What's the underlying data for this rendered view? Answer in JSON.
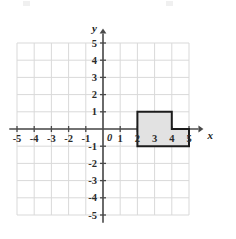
{
  "figure": {
    "axis_labels": {
      "x": "x",
      "y": "y"
    },
    "origin_label": "0"
  },
  "chart_data": {
    "type": "scatter",
    "title": "",
    "xlabel": "x",
    "ylabel": "y",
    "xlim": [
      -5.5,
      5.5
    ],
    "ylim": [
      -5.5,
      5.5
    ],
    "grid": true,
    "grid_step": 1,
    "legend": "none",
    "x_ticks": [
      -5,
      -4,
      -3,
      -2,
      -1,
      1,
      2,
      3,
      4,
      5
    ],
    "y_ticks": [
      -5,
      -4,
      -3,
      -2,
      -1,
      1,
      2,
      3,
      4,
      5
    ],
    "x_tick_labels": [
      "-5",
      "-4",
      "-3",
      "-2",
      "-1",
      "1",
      "2",
      "3",
      "4",
      "5"
    ],
    "y_tick_labels": [
      "-5",
      "-4",
      "-3",
      "-2",
      "-1",
      "1",
      "2",
      "3",
      "4",
      "5"
    ],
    "shapes": [
      {
        "name": "shaded-polygon",
        "kind": "polygon",
        "fill": "#e2e2e2",
        "stroke": "#1c1c1c",
        "stroke_width": 2,
        "vertices": [
          [
            2,
            1
          ],
          [
            4,
            1
          ],
          [
            4,
            0
          ],
          [
            5,
            0
          ],
          [
            5,
            -1
          ],
          [
            2,
            -1
          ]
        ],
        "description": "L-shaped region: rectangle x 2 to 4 from y 0 to 1, joined with rectangle x 2 to 5 from y -1 to 0"
      }
    ]
  },
  "colors": {
    "grid_line": "#d9d9d9",
    "axis_line": "#4a4a4a",
    "shape_fill": "#e2e2e2",
    "shape_stroke": "#1c1c1c",
    "tick_label": "#2b2b2b",
    "background": "#ffffff"
  },
  "geometry": {
    "origin_px": {
      "x": 103,
      "y": 129
    },
    "unit_px": 17.2,
    "grid_min": -5,
    "grid_max": 5
  }
}
